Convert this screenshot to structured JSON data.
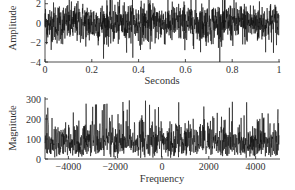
{
  "chart_data": [
    {
      "type": "line",
      "title": "",
      "xlabel": "Seconds",
      "ylabel": "Amplitude",
      "xlim": [
        0,
        1
      ],
      "ylim": [
        -4,
        3
      ],
      "xticks": [
        0,
        0.2,
        0.4,
        0.6,
        0.8,
        1
      ],
      "xtick_labels": [
        "0",
        "0.2",
        "0.4",
        "0.6",
        "0.8",
        "1"
      ],
      "yticks": [
        -4,
        -2,
        0,
        2
      ],
      "ytick_labels": [
        "−4",
        "−2",
        "0",
        "2"
      ],
      "grid": false,
      "series": [
        {
          "name": "white noise signal",
          "description": "dense random noise, roughly zero-mean, unit variance, spanning about -4 to +3+",
          "color": "#111111"
        }
      ]
    },
    {
      "type": "line",
      "title": "",
      "xlabel": "Frequency",
      "ylabel": "Magnitude",
      "xlim": [
        -5000,
        5000
      ],
      "ylim": [
        0,
        300
      ],
      "xticks": [
        -4000,
        -2000,
        0,
        2000,
        4000
      ],
      "xtick_labels": [
        "−4000",
        "−2000",
        "0",
        "2000",
        "4000"
      ],
      "yticks": [
        0,
        100,
        200,
        300
      ],
      "ytick_labels": [
        "0",
        "100",
        "200",
        "300"
      ],
      "grid": false,
      "series": [
        {
          "name": "magnitude spectrum",
          "description": "flat broadband spectrum, dense values mostly 20-200 with peaks up to ~290",
          "color": "#111111"
        }
      ]
    }
  ]
}
